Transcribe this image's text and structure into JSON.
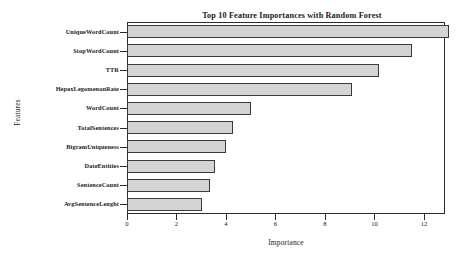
{
  "chart_data": {
    "type": "bar",
    "orientation": "horizontal",
    "title": "Top 10 Feature Importances with Random Forest",
    "xlabel": "Importance",
    "ylabel": "Features",
    "categories": [
      "UniqueWordCount",
      "StopWordCount",
      "TTR",
      "HepaxLegomenonRate",
      "WordCount",
      "TotalSentences",
      "BigramUniqueness",
      "DateEntities",
      "SentenceCount",
      "AvgSentenceLenght"
    ],
    "values": [
      13.0,
      11.5,
      10.2,
      9.1,
      5.0,
      4.3,
      4.0,
      3.55,
      3.35,
      3.05
    ],
    "xlim": [
      0,
      12.85
    ],
    "xticks": [
      0,
      2,
      4,
      6,
      8,
      10,
      12
    ],
    "xtick_labels": [
      "0",
      "2",
      "4",
      "6",
      "8",
      "10",
      "12"
    ],
    "grid": false,
    "legend": false,
    "bar_fill_color": "#d4d4d4",
    "bar_edge_color": "#3a3a3a",
    "background_color": "#ffffff",
    "axis_color": "#2b2b2b"
  }
}
